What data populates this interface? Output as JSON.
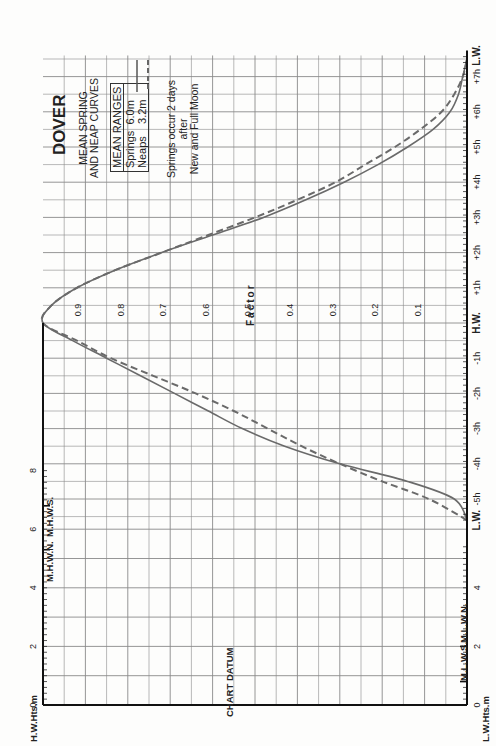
{
  "title": "DOVER",
  "subtitle_lines": [
    "MEAN SPRING",
    "AND NEAP CURVES"
  ],
  "legend": {
    "header": "MEAN RANGES",
    "items": [
      {
        "name": "Springs",
        "value": "6.0m",
        "style": "solid"
      },
      {
        "name": "Neaps",
        "value": "3.2m",
        "style": "dashed"
      }
    ]
  },
  "note_lines": [
    "Springs occur 2 days",
    "after",
    "New and Full Moon"
  ],
  "labels": {
    "factor": "Factor",
    "chart_datum": "CHART DATUM",
    "hw_heights": "H.W.Hts.m",
    "lw_heights": "L.W.Hts.m",
    "mhws": "M.H.W.S.",
    "mhwn": "M.H.W.N.",
    "mlwn": "M.L.W.N.",
    "mlws": "M.L.W.S."
  },
  "colors": {
    "curve": "#6a6a6a",
    "grid": "#8a8a8a",
    "axis": "#111111"
  },
  "chart_data": {
    "type": "line",
    "xlabel": "Time relative to H.W. (hours)",
    "ylabel": "Factor",
    "x_ticks": [
      "L.W.",
      "-5h",
      "-4h",
      "-3h",
      "-2h",
      "-1h",
      "H.W.",
      "+1h",
      "+2h",
      "+3h",
      "+4h",
      "+5h",
      "+6h",
      "+7h",
      "L.W."
    ],
    "factor_ticks": [
      "0.1",
      "0.2",
      "0.3",
      "0.4",
      "0.5",
      "0.6",
      "0.7",
      "0.8",
      "0.9"
    ],
    "ylim": [
      0,
      1
    ],
    "xlim": [
      -5.6,
      7.5
    ],
    "hw_height_ticks": [
      "0",
      "2",
      "4",
      "6",
      "8"
    ],
    "lw_height_ticks": [
      "0",
      "2",
      "4"
    ],
    "datums": {
      "MHWS": 6.8,
      "MHWN": 5.3,
      "MLWN": 2.0,
      "MLWS": 0.8
    },
    "series": [
      {
        "name": "Springs (range 6.0m)",
        "style": "solid",
        "x": [
          -5.6,
          -5.0,
          -4.5,
          -4.0,
          -3.5,
          -3.0,
          -2.5,
          -2.0,
          -1.5,
          -1.0,
          -0.5,
          0,
          0.5,
          1.0,
          1.5,
          2.0,
          2.5,
          3.0,
          3.5,
          4.0,
          4.5,
          5.0,
          5.5,
          6.0,
          6.5,
          7.0,
          7.5
        ],
        "values": [
          0.0,
          0.03,
          0.14,
          0.3,
          0.43,
          0.53,
          0.61,
          0.69,
          0.77,
          0.85,
          0.93,
          1.0,
          0.98,
          0.92,
          0.83,
          0.72,
          0.6,
          0.48,
          0.38,
          0.29,
          0.21,
          0.14,
          0.08,
          0.04,
          0.02,
          0.01,
          0.0
        ]
      },
      {
        "name": "Neaps (range 3.2m)",
        "style": "dashed",
        "x": [
          -5.6,
          -5.0,
          -4.5,
          -4.0,
          -3.5,
          -3.0,
          -2.5,
          -2.0,
          -1.5,
          -1.0,
          -0.5,
          0,
          0.5,
          1.0,
          1.5,
          2.0,
          2.5,
          3.0,
          3.5,
          4.0,
          4.5,
          5.0,
          5.5,
          6.0,
          6.5,
          7.0,
          7.5
        ],
        "values": [
          0.0,
          0.09,
          0.2,
          0.3,
          0.39,
          0.47,
          0.55,
          0.64,
          0.74,
          0.84,
          0.92,
          1.0,
          0.98,
          0.92,
          0.83,
          0.72,
          0.61,
          0.5,
          0.4,
          0.31,
          0.24,
          0.17,
          0.11,
          0.06,
          0.03,
          0.01,
          0.0
        ]
      }
    ],
    "grid": true
  }
}
